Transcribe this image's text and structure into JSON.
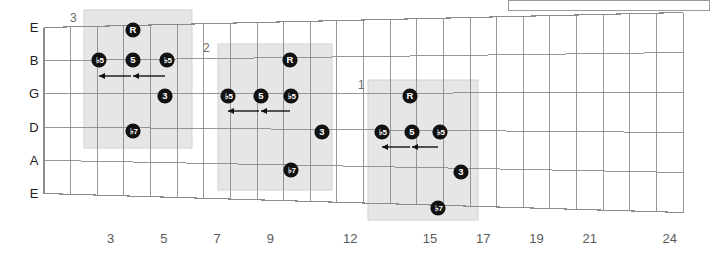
{
  "diagram": {
    "type": "guitar-fretboard-scale-diagram",
    "title": "",
    "string_labels": [
      "E",
      "B",
      "G",
      "D",
      "A",
      "E"
    ],
    "fret_numbers": [
      "3",
      "5",
      "7",
      "9",
      "12",
      "15",
      "17",
      "19",
      "21",
      "24"
    ],
    "fret_number_positions": [
      3,
      5,
      7,
      9,
      12,
      15,
      17,
      19,
      21,
      24
    ],
    "total_frets": 24,
    "colors": {
      "grid": "#8c8c8c",
      "nut": "#8c8c8c",
      "block_fill": "#e6e6e6",
      "block_stroke": "#d2d2d2",
      "dot_fill": "#111111",
      "dot_text": "#ffffff",
      "label_text": "#1d1d1d",
      "fret_number_text": "#5a5a5a",
      "block_label_text": "#6a6a6a",
      "arrow": "#111111"
    },
    "blocks": [
      {
        "label": "3",
        "label_x": 70,
        "label_y": 22,
        "rect": {
          "x": 84,
          "y": 10,
          "width": 108,
          "height": 138
        },
        "notes": [
          {
            "degree": "R",
            "x": 133,
            "y": 30,
            "flat": false
          },
          {
            "degree": "5",
            "x": 99,
            "y": 60,
            "flat": true
          },
          {
            "degree": "5",
            "x": 133,
            "y": 60,
            "flat": false
          },
          {
            "degree": "5",
            "x": 167,
            "y": 60,
            "flat": true
          },
          {
            "degree": "3",
            "x": 165,
            "y": 96,
            "flat": false
          },
          {
            "degree": "7",
            "x": 133,
            "y": 131,
            "flat": true
          }
        ],
        "arrows": [
          {
            "x1": 131,
            "y1": 76,
            "x2": 99,
            "y2": 76
          },
          {
            "x1": 165,
            "y1": 76,
            "x2": 133,
            "y2": 76
          }
        ]
      },
      {
        "label": "2",
        "label_x": 203,
        "label_y": 52,
        "rect": {
          "x": 218,
          "y": 44,
          "width": 114,
          "height": 146
        },
        "notes": [
          {
            "degree": "R",
            "x": 290,
            "y": 60,
            "flat": false
          },
          {
            "degree": "5",
            "x": 228,
            "y": 96,
            "flat": true
          },
          {
            "degree": "5",
            "x": 261,
            "y": 96,
            "flat": false
          },
          {
            "degree": "5",
            "x": 291,
            "y": 96,
            "flat": true
          },
          {
            "degree": "3",
            "x": 322,
            "y": 132,
            "flat": false
          },
          {
            "degree": "7",
            "x": 291,
            "y": 170,
            "flat": true
          }
        ],
        "arrows": [
          {
            "x1": 259,
            "y1": 111,
            "x2": 228,
            "y2": 111
          },
          {
            "x1": 290,
            "y1": 111,
            "x2": 261,
            "y2": 111
          }
        ]
      },
      {
        "label": "1",
        "label_x": 358,
        "label_y": 89,
        "rect": {
          "x": 368,
          "y": 80,
          "width": 110,
          "height": 140
        },
        "notes": [
          {
            "degree": "R",
            "x": 410,
            "y": 96,
            "flat": false
          },
          {
            "degree": "5",
            "x": 382,
            "y": 132,
            "flat": true
          },
          {
            "degree": "5",
            "x": 412,
            "y": 132,
            "flat": false
          },
          {
            "degree": "5",
            "x": 440,
            "y": 132,
            "flat": true
          },
          {
            "degree": "3",
            "x": 461,
            "y": 172,
            "flat": false
          },
          {
            "degree": "7",
            "x": 438,
            "y": 208,
            "flat": true
          }
        ],
        "arrows": [
          {
            "x1": 410,
            "y1": 147,
            "x2": 382,
            "y2": 147
          },
          {
            "x1": 438,
            "y1": 147,
            "x2": 412,
            "y2": 147
          }
        ]
      }
    ],
    "legend_box": {
      "x": 508,
      "y": 0,
      "width": 202,
      "height": 11,
      "content": ""
    }
  }
}
